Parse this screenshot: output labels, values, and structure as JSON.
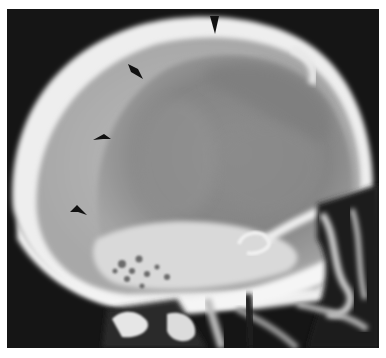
{
  "image": {
    "subject": "lateral skull radiograph",
    "background_color": "#151515",
    "bone_color": "#f2f2f2",
    "soft_tissue_color": "#9a9a9a",
    "arrowhead_color": "#111111",
    "arrowheads": [
      {
        "id": 1,
        "tip_x": 213,
        "tip_y": 25,
        "points_to": "down"
      },
      {
        "id": 2,
        "tip_x": 136,
        "tip_y": 70,
        "points_to": "down-right"
      },
      {
        "id": 3,
        "tip_x": 104,
        "tip_y": 130,
        "points_to": "right"
      },
      {
        "id": 4,
        "tip_x": 80,
        "tip_y": 205,
        "points_to": "right"
      }
    ]
  }
}
